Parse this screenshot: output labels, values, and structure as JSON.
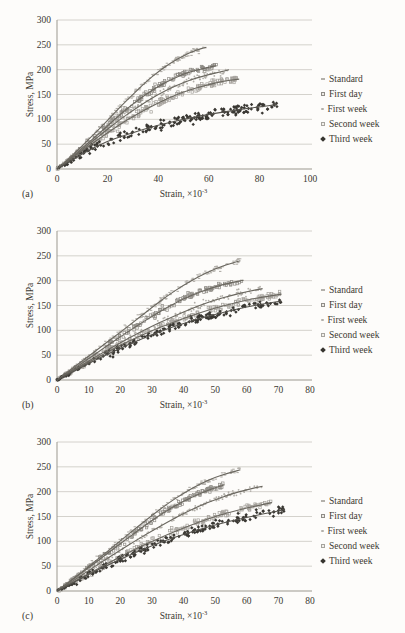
{
  "figure": {
    "panels": [
      {
        "label": "(a)"
      },
      {
        "label": "(b)"
      },
      {
        "label": "(c)"
      }
    ]
  },
  "colors": {
    "background": "#fdfcfa",
    "text": "#3b3831",
    "gridline": "#c9c6c0",
    "axis": "#9b988f",
    "trend_line": "#6a675f",
    "trend_line_dark": "#55534d"
  },
  "chart_data": [
    {
      "type": "scatter",
      "panel": "(a)",
      "xlabel": "Strain, ×10⁻³",
      "xlabel_base": "Strain, ×10",
      "xlabel_sup": "-3",
      "ylabel": "Stress, MPa",
      "xlim": [
        0,
        100
      ],
      "ylim": [
        0,
        300
      ],
      "xticks": [
        0,
        20,
        40,
        60,
        80,
        100
      ],
      "yticks": [
        0,
        50,
        100,
        150,
        200,
        250,
        300
      ],
      "grid": "horizontal",
      "legend_position": "right",
      "series": [
        {
          "name": "Standard",
          "marker": "dash",
          "point_color": "#b2afa9",
          "line_color": "#6a675f",
          "n_points": 150,
          "jitter": 5,
          "trend": [
            [
              0,
              0
            ],
            [
              5,
              22
            ],
            [
              10,
              47
            ],
            [
              15,
              72
            ],
            [
              20,
              98
            ],
            [
              25,
              125
            ],
            [
              30,
              150
            ],
            [
              35,
              175
            ],
            [
              40,
              196
            ],
            [
              45,
              214
            ],
            [
              50,
              228
            ],
            [
              55,
              240
            ],
            [
              59,
              245
            ]
          ]
        },
        {
          "name": "First day",
          "marker": "open-square",
          "point_color": "#8e8b85",
          "line_color": "#6a675f",
          "n_points": 150,
          "jitter": 5,
          "trend": [
            [
              0,
              0
            ],
            [
              5,
              20
            ],
            [
              10,
              42
            ],
            [
              15,
              64
            ],
            [
              20,
              87
            ],
            [
              25,
              110
            ],
            [
              30,
              131
            ],
            [
              35,
              150
            ],
            [
              40,
              166
            ],
            [
              45,
              180
            ],
            [
              50,
              191
            ],
            [
              55,
              199
            ],
            [
              60,
              205
            ],
            [
              63,
              208
            ]
          ]
        },
        {
          "name": "First week",
          "marker": "dot",
          "point_color": "#b2afa9",
          "line_color": "#6a675f",
          "n_points": 160,
          "jitter": 5.5,
          "trend": [
            [
              0,
              0
            ],
            [
              5,
              19
            ],
            [
              10,
              39
            ],
            [
              15,
              60
            ],
            [
              20,
              80
            ],
            [
              25,
              100
            ],
            [
              30,
              118
            ],
            [
              35,
              135
            ],
            [
              40,
              150
            ],
            [
              45,
              163
            ],
            [
              50,
              174
            ],
            [
              55,
              183
            ],
            [
              60,
              190
            ],
            [
              65,
              196
            ],
            [
              68,
              200
            ]
          ]
        },
        {
          "name": "Second week",
          "marker": "open-square",
          "point_color": "#a5a29c",
          "line_color": "#6a675f",
          "n_points": 170,
          "jitter": 6,
          "trend": [
            [
              0,
              0
            ],
            [
              5,
              18
            ],
            [
              10,
              37
            ],
            [
              15,
              55
            ],
            [
              20,
              73
            ],
            [
              25,
              90
            ],
            [
              30,
              106
            ],
            [
              35,
              120
            ],
            [
              40,
              133
            ],
            [
              45,
              145
            ],
            [
              50,
              155
            ],
            [
              55,
              163
            ],
            [
              60,
              170
            ],
            [
              65,
              176
            ],
            [
              72,
              181
            ]
          ]
        },
        {
          "name": "Third week",
          "marker": "diamond",
          "point_color": "#3a3833",
          "line_color": "#55534d",
          "n_points": 200,
          "jitter": 8,
          "trend": [
            [
              0,
              0
            ],
            [
              5,
              15
            ],
            [
              10,
              30
            ],
            [
              15,
              44
            ],
            [
              20,
              56
            ],
            [
              25,
              65
            ],
            [
              30,
              73
            ],
            [
              35,
              81
            ],
            [
              40,
              88
            ],
            [
              45,
              94
            ],
            [
              50,
              100
            ],
            [
              55,
              105
            ],
            [
              60,
              110
            ],
            [
              65,
              114
            ],
            [
              70,
              118
            ],
            [
              75,
              122
            ],
            [
              80,
              125
            ],
            [
              87,
              130
            ]
          ]
        }
      ]
    },
    {
      "type": "scatter",
      "panel": "(b)",
      "xlabel": "Strain, ×10⁻³",
      "xlabel_base": "Strain, ×10",
      "xlabel_sup": "-3",
      "ylabel": "Stress, MPa",
      "xlim": [
        0,
        80
      ],
      "ylim": [
        0,
        300
      ],
      "xticks": [
        0,
        10,
        20,
        30,
        40,
        50,
        60,
        70,
        80
      ],
      "yticks": [
        0,
        50,
        100,
        150,
        200,
        250,
        300
      ],
      "grid": "horizontal",
      "legend_position": "right",
      "series": [
        {
          "name": "Standard",
          "marker": "dash",
          "point_color": "#b2afa9",
          "line_color": "#6a675f",
          "n_points": 150,
          "jitter": 5,
          "trend": [
            [
              0,
              0
            ],
            [
              5,
              24
            ],
            [
              10,
              48
            ],
            [
              15,
              72
            ],
            [
              20,
              96
            ],
            [
              25,
              121
            ],
            [
              30,
              146
            ],
            [
              35,
              170
            ],
            [
              40,
              191
            ],
            [
              45,
              209
            ],
            [
              50,
              224
            ],
            [
              55,
              235
            ],
            [
              58,
              240
            ]
          ]
        },
        {
          "name": "First day",
          "marker": "open-square",
          "point_color": "#8e8b85",
          "line_color": "#6a675f",
          "n_points": 150,
          "jitter": 5,
          "trend": [
            [
              0,
              0
            ],
            [
              5,
              21
            ],
            [
              10,
              43
            ],
            [
              15,
              65
            ],
            [
              20,
              87
            ],
            [
              25,
              108
            ],
            [
              30,
              128
            ],
            [
              35,
              147
            ],
            [
              40,
              163
            ],
            [
              45,
              177
            ],
            [
              50,
              188
            ],
            [
              55,
              196
            ],
            [
              59,
              201
            ]
          ]
        },
        {
          "name": "First week",
          "marker": "dot",
          "point_color": "#b2afa9",
          "line_color": "#6a675f",
          "n_points": 160,
          "jitter": 5.5,
          "trend": [
            [
              0,
              0
            ],
            [
              5,
              19
            ],
            [
              10,
              38
            ],
            [
              15,
              57
            ],
            [
              20,
              75
            ],
            [
              25,
              92
            ],
            [
              30,
              108
            ],
            [
              35,
              123
            ],
            [
              40,
              137
            ],
            [
              45,
              150
            ],
            [
              50,
              161
            ],
            [
              55,
              170
            ],
            [
              60,
              178
            ],
            [
              65,
              184
            ]
          ]
        },
        {
          "name": "Second week",
          "marker": "open-square",
          "point_color": "#a5a29c",
          "line_color": "#6a675f",
          "n_points": 170,
          "jitter": 6,
          "trend": [
            [
              0,
              0
            ],
            [
              5,
              18
            ],
            [
              10,
              36
            ],
            [
              15,
              53
            ],
            [
              20,
              70
            ],
            [
              25,
              85
            ],
            [
              30,
              99
            ],
            [
              35,
              112
            ],
            [
              40,
              124
            ],
            [
              45,
              135
            ],
            [
              50,
              145
            ],
            [
              55,
              153
            ],
            [
              60,
              161
            ],
            [
              65,
              167
            ],
            [
              71,
              173
            ]
          ]
        },
        {
          "name": "Third week",
          "marker": "diamond",
          "point_color": "#3a3833",
          "line_color": "#55534d",
          "n_points": 180,
          "jitter": 6.5,
          "trend": [
            [
              0,
              0
            ],
            [
              5,
              16
            ],
            [
              10,
              33
            ],
            [
              15,
              49
            ],
            [
              20,
              64
            ],
            [
              25,
              78
            ],
            [
              30,
              91
            ],
            [
              35,
              103
            ],
            [
              40,
              114
            ],
            [
              45,
              124
            ],
            [
              50,
              132
            ],
            [
              55,
              140
            ],
            [
              60,
              147
            ],
            [
              65,
              153
            ],
            [
              71,
              159
            ]
          ]
        }
      ]
    },
    {
      "type": "scatter",
      "panel": "(c)",
      "xlabel": "Strain, ×10⁻³",
      "xlabel_base": "Strain, ×10",
      "xlabel_sup": "-3",
      "ylabel": "Stress, MPa",
      "xlim": [
        0,
        80
      ],
      "ylim": [
        0,
        300
      ],
      "xticks": [
        0,
        10,
        20,
        30,
        40,
        50,
        60,
        70,
        80
      ],
      "yticks": [
        0,
        50,
        100,
        150,
        200,
        250,
        300
      ],
      "grid": "horizontal",
      "legend_position": "right",
      "series": [
        {
          "name": "Standard",
          "marker": "dash",
          "point_color": "#b2afa9",
          "line_color": "#6a675f",
          "n_points": 150,
          "jitter": 5,
          "trend": [
            [
              0,
              0
            ],
            [
              5,
              24
            ],
            [
              10,
              49
            ],
            [
              15,
              75
            ],
            [
              20,
              101
            ],
            [
              25,
              127
            ],
            [
              30,
              152
            ],
            [
              35,
              176
            ],
            [
              40,
              197
            ],
            [
              45,
              215
            ],
            [
              50,
              229
            ],
            [
              55,
              239
            ],
            [
              58,
              244
            ]
          ]
        },
        {
          "name": "First day",
          "marker": "open-square",
          "point_color": "#8e8b85",
          "line_color": "#6a675f",
          "n_points": 140,
          "jitter": 5,
          "trend": [
            [
              0,
              0
            ],
            [
              5,
              23
            ],
            [
              10,
              47
            ],
            [
              15,
              71
            ],
            [
              20,
              95
            ],
            [
              25,
              119
            ],
            [
              30,
              142
            ],
            [
              35,
              163
            ],
            [
              40,
              181
            ],
            [
              45,
              196
            ],
            [
              50,
              208
            ],
            [
              53,
              214
            ]
          ]
        },
        {
          "name": "First week",
          "marker": "dot",
          "point_color": "#b2afa9",
          "line_color": "#6a675f",
          "n_points": 160,
          "jitter": 5.5,
          "trend": [
            [
              0,
              0
            ],
            [
              5,
              20
            ],
            [
              10,
              41
            ],
            [
              15,
              62
            ],
            [
              20,
              82
            ],
            [
              25,
              102
            ],
            [
              30,
              121
            ],
            [
              35,
              139
            ],
            [
              40,
              156
            ],
            [
              45,
              171
            ],
            [
              50,
              184
            ],
            [
              55,
              195
            ],
            [
              60,
              204
            ],
            [
              65,
              211
            ]
          ]
        },
        {
          "name": "Second week",
          "marker": "open-square",
          "point_color": "#a5a29c",
          "line_color": "#6a675f",
          "n_points": 170,
          "jitter": 6,
          "trend": [
            [
              0,
              0
            ],
            [
              5,
              17
            ],
            [
              10,
              35
            ],
            [
              15,
              52
            ],
            [
              20,
              69
            ],
            [
              25,
              85
            ],
            [
              30,
              100
            ],
            [
              35,
              114
            ],
            [
              40,
              127
            ],
            [
              45,
              139
            ],
            [
              50,
              150
            ],
            [
              55,
              159
            ],
            [
              60,
              167
            ],
            [
              65,
              174
            ],
            [
              68,
              178
            ]
          ]
        },
        {
          "name": "Third week",
          "marker": "diamond",
          "point_color": "#3a3833",
          "line_color": "#55534d",
          "n_points": 180,
          "jitter": 6.5,
          "trend": [
            [
              0,
              0
            ],
            [
              5,
              16
            ],
            [
              10,
              33
            ],
            [
              15,
              49
            ],
            [
              20,
              64
            ],
            [
              25,
              78
            ],
            [
              30,
              91
            ],
            [
              35,
              103
            ],
            [
              40,
              114
            ],
            [
              45,
              124
            ],
            [
              50,
              133
            ],
            [
              55,
              141
            ],
            [
              60,
              148
            ],
            [
              65,
              155
            ],
            [
              70,
              161
            ],
            [
              72,
              164
            ]
          ]
        }
      ]
    }
  ]
}
